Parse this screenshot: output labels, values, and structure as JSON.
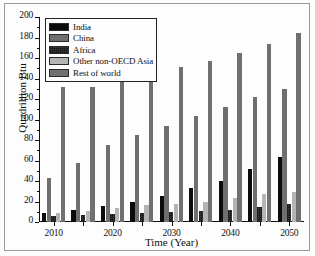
{
  "chart_data": {
    "type": "bar",
    "title": "",
    "xlabel": "Time (Year)",
    "ylabel": "Quadrillion Btu",
    "categories": [
      "2010",
      "2015",
      "2020",
      "2025",
      "2030",
      "2035",
      "2040",
      "2045",
      "2050"
    ],
    "x_tick_labels": [
      "2010",
      "2020",
      "2030",
      "2040",
      "2050"
    ],
    "x_tick_categories": [
      "2010",
      "2020",
      "2030",
      "2040",
      "2050"
    ],
    "y_tick_labels": [
      "0",
      "20",
      "40",
      "60",
      "80",
      "100",
      "120",
      "140",
      "160",
      "180",
      "200"
    ],
    "ylim": [
      0,
      200
    ],
    "y_major_step": 20,
    "grid": false,
    "legend_position": "top-left",
    "series": [
      {
        "name": "India",
        "pattern": "solid-black",
        "color": "#0c0c0c",
        "values": [
          9,
          12,
          16,
          20,
          25,
          33,
          40,
          52,
          63
        ]
      },
      {
        "name": "China",
        "pattern": "medium-gray-dotted",
        "color": "#6f6f6f",
        "values": [
          43,
          58,
          75,
          85,
          94,
          103,
          112,
          122,
          130
        ]
      },
      {
        "name": "Africa",
        "pattern": "dark-gray-crosshatch",
        "color": "#3f3f3f",
        "values": [
          6,
          7,
          8,
          9,
          10,
          11,
          12,
          15,
          18
        ]
      },
      {
        "name": "Other non-OECD Asia",
        "pattern": "light-gray-dotted",
        "color": "#b4b4b4",
        "values": [
          9,
          11,
          14,
          17,
          18,
          20,
          23,
          27,
          29
        ]
      },
      {
        "name": "Rest of world",
        "pattern": "dark-dotted",
        "color": "#707070",
        "values": [
          132,
          132,
          139,
          144,
          151,
          157,
          165,
          174,
          184
        ]
      }
    ]
  }
}
